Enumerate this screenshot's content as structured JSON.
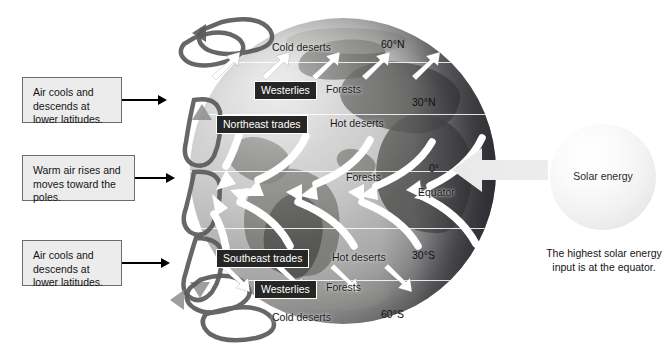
{
  "diagram": {
    "type": "earth-circulation-diagram"
  },
  "callouts": [
    {
      "id": "callout-top",
      "lines": [
        "Air cools and",
        "descends at",
        "lower latitudes."
      ]
    },
    {
      "id": "callout-middle",
      "lines": [
        "Warm air rises and",
        "moves toward the",
        "poles."
      ]
    },
    {
      "id": "callout-bottom",
      "lines": [
        "Air cools and",
        "descends at",
        "lower latitudes."
      ]
    }
  ],
  "globe": {
    "latitude_labels": [
      {
        "id": "lat-60n",
        "text": "60°N"
      },
      {
        "id": "lat-30n",
        "text": "30°N"
      },
      {
        "id": "lat-0",
        "text": "0°"
      },
      {
        "id": "lat-30s",
        "text": "30°S"
      },
      {
        "id": "lat-60s",
        "text": "60°S"
      }
    ],
    "equator_label": "Equator",
    "wind_belts": [
      {
        "id": "wind-westerlies-north",
        "text": "Westerlies"
      },
      {
        "id": "wind-northeast-trades",
        "text": "Northeast trades"
      },
      {
        "id": "wind-southeast-trades",
        "text": "Southeast trades"
      },
      {
        "id": "wind-westerlies-south",
        "text": "Westerlies"
      }
    ],
    "biome_labels": [
      {
        "id": "biome-cold-deserts-north",
        "text": "Cold deserts"
      },
      {
        "id": "biome-forests-north",
        "text": "Forests"
      },
      {
        "id": "biome-hot-deserts-north",
        "text": "Hot deserts"
      },
      {
        "id": "biome-forests-equator",
        "text": "Forests"
      },
      {
        "id": "biome-hot-deserts-south",
        "text": "Hot deserts"
      },
      {
        "id": "biome-forests-south",
        "text": "Forests"
      },
      {
        "id": "biome-cold-deserts-south",
        "text": "Cold deserts"
      }
    ]
  },
  "solar": {
    "sun_label": "Solar energy",
    "caption_lines": [
      "The highest solar energy",
      "input is at the equator."
    ]
  },
  "colors": {
    "callout_fill": "#ececed",
    "callout_border": "#6d6d6d",
    "chip_fill": "#262626",
    "chip_text": "#ffffff",
    "arrow_black": "#000000",
    "wind_arrow": "#ffffff",
    "cell_loop": "#5f5f5f",
    "solar_arrow": "#e3e3e3",
    "sun_fill": "#f4f4f4"
  }
}
